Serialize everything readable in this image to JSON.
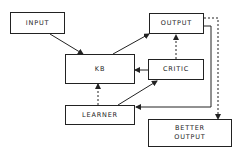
{
  "diagram": {
    "nodes": {
      "input": {
        "label": "INPUT"
      },
      "output": {
        "label": "OUTPUT"
      },
      "kb": {
        "label": "KB"
      },
      "critic": {
        "label": "CRITIC"
      },
      "learner": {
        "label": "LEARNER"
      },
      "better_output": {
        "label_line1": "BETTER",
        "label_line2": "OUTPUT"
      }
    },
    "edges": [
      {
        "from": "INPUT",
        "to": "KB",
        "style": "solid"
      },
      {
        "from": "KB",
        "to": "OUTPUT",
        "style": "solid"
      },
      {
        "from": "CRITIC",
        "to": "OUTPUT",
        "style": "dashed"
      },
      {
        "from": "CRITIC",
        "to": "KB",
        "style": "solid"
      },
      {
        "from": "LEARNER",
        "to": "KB",
        "style": "dashed"
      },
      {
        "from": "LEARNER",
        "to": "CRITIC",
        "style": "solid"
      },
      {
        "from": "OUTPUT",
        "to": "LEARNER",
        "style": "solid"
      },
      {
        "from": "OUTPUT",
        "to": "BETTER OUTPUT",
        "style": "dashed"
      }
    ],
    "colors": {
      "stroke": "#222222",
      "background": "#ffffff"
    }
  }
}
